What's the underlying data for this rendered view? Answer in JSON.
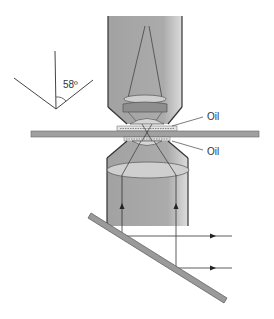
{
  "diagram": {
    "angle_label": "58º",
    "oil_top_label": "Oil",
    "oil_bottom_label": "Oil"
  },
  "colors": {
    "body_gray": "#a9a9a9",
    "lens_light": "#cfcfcf",
    "lens_dark": "#8e8e8e",
    "outline": "#333333",
    "slide": "#a0a0a0",
    "mirror": "#9a9a9a"
  }
}
